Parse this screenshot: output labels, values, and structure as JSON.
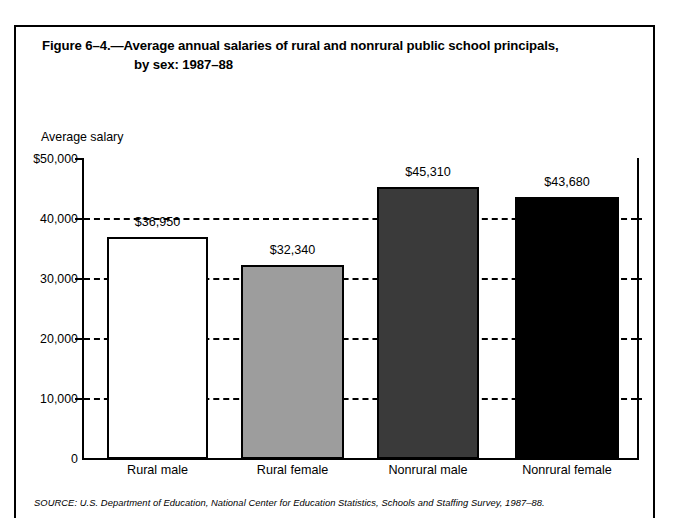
{
  "figure": {
    "title_line1": "Figure 6–4.—Average annual salaries of rural and nonrural public school principals,",
    "title_line2": "by sex: 1987–88",
    "source_note": "SOURCE: U.S. Department of Education, National Center for Education Statistics, Schools and Staffing Survey, 1987–88."
  },
  "chart_data": {
    "type": "bar",
    "title": "Figure 6–4.—Average annual salaries of rural and nonrural public school principals, by sex: 1987–88",
    "xlabel": "",
    "ylabel": "Average salary",
    "categories": [
      "Rural male",
      "Rural female",
      "Nonrural male",
      "Nonrural female"
    ],
    "values": [
      36950,
      32340,
      45310,
      43680
    ],
    "value_labels": [
      "$36,950",
      "$32,340",
      "$45,310",
      "$43,680"
    ],
    "bar_colors": [
      "#ffffff",
      "#9d9d9d",
      "#3a3a3a",
      "#000000"
    ],
    "ylim": [
      0,
      50000
    ],
    "ytick_values": [
      0,
      10000,
      20000,
      30000,
      40000,
      50000
    ],
    "ytick_labels": [
      "0",
      "10,000",
      "20,000",
      "30,000",
      "40,000",
      "$50,000"
    ],
    "grid": "horizontal-dashed",
    "gridline_values": [
      10000,
      20000,
      30000,
      40000
    ],
    "legend": "none"
  }
}
